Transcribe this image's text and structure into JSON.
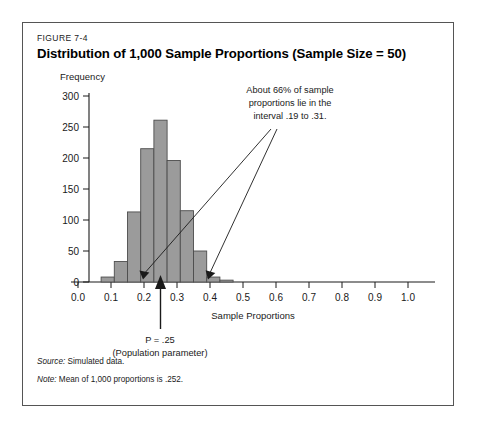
{
  "figure": {
    "number": "FIGURE 7-4",
    "title": "Distribution of 1,000 Sample Proportions (Sample Size = 50)"
  },
  "notes": {
    "source_label": "Source:",
    "source_text": " Simulated data.",
    "note_label": "Note:",
    "note_text": " Mean of 1,000 proportions is .252."
  },
  "annotations": {
    "callout_line1": "About 66% of sample",
    "callout_line2": "proportions lie in the",
    "callout_line3": "interval .19 to .31.",
    "parameter_line1": "P = .25",
    "parameter_line2": "(Population parameter)"
  },
  "colors": {
    "bar_fill": "#9b9b9b",
    "bar_stroke": "#4d4d4d",
    "axis": "#1a1a1a",
    "frame": "#555555",
    "text": "#1a1a1a"
  },
  "chart_data": {
    "type": "bar",
    "title": "Distribution of 1,000 Sample Proportions (Sample Size = 50)",
    "xlabel": "Sample Proportions",
    "ylabel": "Frequency",
    "xlim": [
      0.0,
      1.0
    ],
    "ylim": [
      0,
      300
    ],
    "xticks": [
      "0.0",
      "0.1",
      "0.2",
      "0.3",
      "0.4",
      "0.5",
      "0.6",
      "0.7",
      "0.8",
      "0.9",
      "1.0"
    ],
    "xtick_values": [
      0.0,
      0.1,
      0.2,
      0.3,
      0.4,
      0.5,
      0.6,
      0.7,
      0.8,
      0.9,
      1.0
    ],
    "yticks": [
      "0",
      "50",
      "100",
      "150",
      "200",
      "250",
      "300"
    ],
    "ytick_values": [
      0,
      50,
      100,
      150,
      200,
      250,
      300
    ],
    "grid": false,
    "bin_width": 0.04,
    "bin_left_edges": [
      0.07,
      0.11,
      0.15,
      0.19,
      0.23,
      0.27,
      0.31,
      0.35,
      0.39,
      0.43
    ],
    "values": [
      8,
      33,
      113,
      215,
      261,
      196,
      115,
      50,
      8,
      3
    ],
    "bin_centers": [
      0.09,
      0.13,
      0.17,
      0.21,
      0.25,
      0.29,
      0.33,
      0.37,
      0.41,
      0.45
    ],
    "population_parameter": 0.25,
    "interval_low": 0.19,
    "interval_high": 0.31,
    "interval_coverage_pct": 66,
    "n_samples": 1000,
    "sample_size": 50,
    "mean_of_proportions": 0.252
  }
}
